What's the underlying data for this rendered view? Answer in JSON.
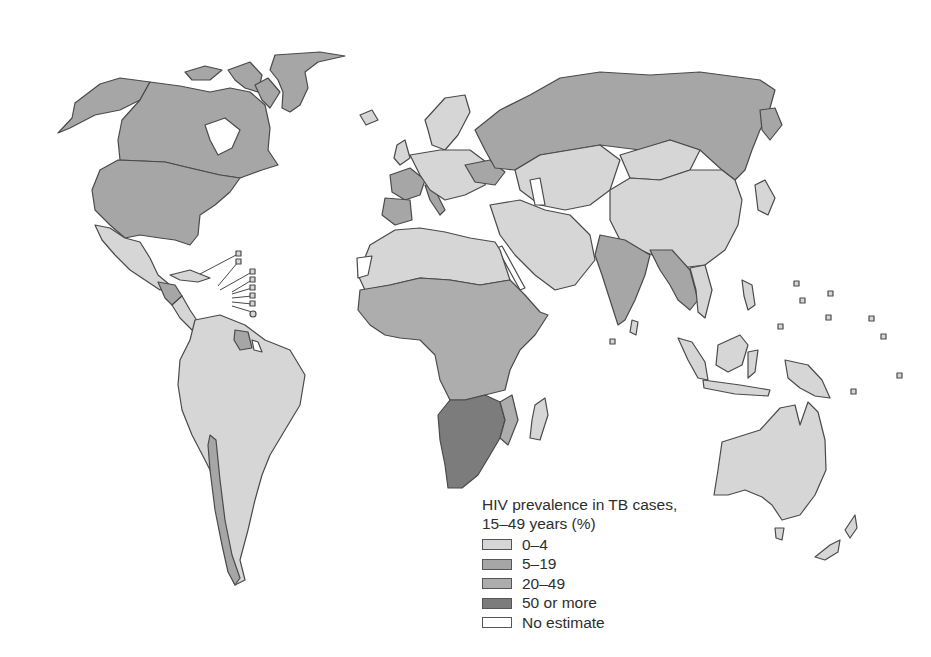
{
  "map": {
    "type": "choropleth",
    "subject": "HIV prevalence in TB cases, 15-49 years (%)",
    "palette": {
      "0-4": "#d6d6d6",
      "5-19": "#a6a6a6",
      "20-49": "#adadad",
      "50 or more": "#7c7c7c",
      "No estimate": "#ffffff"
    },
    "regions": [
      {
        "name": "Canada",
        "category": "5-19"
      },
      {
        "name": "United States",
        "category": "5-19"
      },
      {
        "name": "Greenland",
        "category": "5-19"
      },
      {
        "name": "Mexico",
        "category": "0-4"
      },
      {
        "name": "Central America",
        "category": "5-19"
      },
      {
        "name": "South America",
        "category": "0-4"
      },
      {
        "name": "Guyana/Suriname",
        "category": "5-19"
      },
      {
        "name": "Chile",
        "category": "5-19"
      },
      {
        "name": "Western Europe (France, Spain, Portugal, Italy)",
        "category": "5-19"
      },
      {
        "name": "Northern/Central Europe",
        "category": "0-4"
      },
      {
        "name": "Ukraine",
        "category": "5-19"
      },
      {
        "name": "Russia",
        "category": "5-19"
      },
      {
        "name": "Central Asia",
        "category": "0-4"
      },
      {
        "name": "China",
        "category": "0-4"
      },
      {
        "name": "Mongolia",
        "category": "0-4"
      },
      {
        "name": "Japan",
        "category": "0-4"
      },
      {
        "name": "Middle East",
        "category": "0-4"
      },
      {
        "name": "North Africa",
        "category": "0-4"
      },
      {
        "name": "Western Sahara",
        "category": "No estimate"
      },
      {
        "name": "West/Central/East Africa",
        "category": "20-49"
      },
      {
        "name": "Southern Africa",
        "category": "50 or more"
      },
      {
        "name": "Madagascar",
        "category": "0-4"
      },
      {
        "name": "India",
        "category": "5-19"
      },
      {
        "name": "Myanmar/Thailand/Cambodia",
        "category": "5-19"
      },
      {
        "name": "Southeast Asia islands",
        "category": "0-4"
      },
      {
        "name": "Australia",
        "category": "0-4"
      },
      {
        "name": "New Zealand",
        "category": "0-4"
      }
    ]
  },
  "legend": {
    "title_line1": "HIV prevalence in TB cases,",
    "title_line2": "15–49 years (%)",
    "items": [
      {
        "label": "0–4",
        "color": "#d6d6d6"
      },
      {
        "label": "5–19",
        "color": "#a6a6a6"
      },
      {
        "label": "20–49",
        "color": "#adadad"
      },
      {
        "label": "50 or more",
        "color": "#7c7c7c"
      },
      {
        "label": "No estimate",
        "color": "#ffffff"
      }
    ]
  }
}
